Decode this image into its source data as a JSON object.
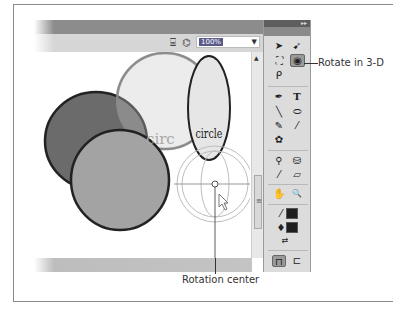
{
  "figure": {
    "callouts": {
      "rotate_3d": "Rotate in 3-D",
      "rotation_center": "Rotation center"
    }
  },
  "edit_bar": {
    "icons": [
      "edit-scene-icon",
      "edit-symbols-icon"
    ],
    "zoom_value": "100%",
    "zoom_dropdown_arrow": "▼"
  },
  "stage": {
    "objects": [
      {
        "type": "circle",
        "fill": "#6b6b6b",
        "stroke": "#222222"
      },
      {
        "type": "circle",
        "fill": "#a3a3a3",
        "stroke": "#222222"
      },
      {
        "type": "text-circle-ghost",
        "label": "circ",
        "color": "#b0b0b0"
      },
      {
        "type": "ellipse",
        "label": "circle",
        "fill": "#e6e6e6",
        "stroke": "#222222"
      }
    ],
    "gizmo": "3d-rotation-guides"
  },
  "tools_panel": {
    "collapse_glyph": "▸▸",
    "tools": [
      {
        "name": "selection-tool",
        "glyph": "➤"
      },
      {
        "name": "subselection-tool",
        "glyph": "➹"
      },
      {
        "name": "free-transform-tool",
        "glyph": "⛶"
      },
      {
        "name": "3d-rotation-tool",
        "glyph": "◉",
        "selected": true
      },
      {
        "name": "lasso-tool",
        "glyph": "ᑭ"
      },
      {
        "name": "pen-tool",
        "glyph": "✒"
      },
      {
        "name": "text-tool",
        "glyph": "T"
      },
      {
        "name": "line-tool",
        "glyph": "╲"
      },
      {
        "name": "oval-tool",
        "glyph": "⬭"
      },
      {
        "name": "pencil-tool",
        "glyph": "✎"
      },
      {
        "name": "brush-tool",
        "glyph": "⁄"
      },
      {
        "name": "deco-tool",
        "glyph": "✿"
      },
      {
        "name": "bone-tool",
        "glyph": "⚲"
      },
      {
        "name": "paint-bucket-tool",
        "glyph": "⛁"
      },
      {
        "name": "eyedropper-tool",
        "glyph": "⁄"
      },
      {
        "name": "eraser-tool",
        "glyph": "▱"
      },
      {
        "name": "hand-tool",
        "glyph": "✋"
      },
      {
        "name": "zoom-tool",
        "glyph": "🔍"
      },
      {
        "name": "stroke-color",
        "glyph": "⁄"
      },
      {
        "name": "fill-color",
        "glyph": "♦"
      },
      {
        "name": "swap-colors",
        "glyph": "⇄"
      },
      {
        "name": "snap-to-objects",
        "glyph": "⊓"
      },
      {
        "name": "option-icon",
        "glyph": "⊏"
      }
    ],
    "colors": {
      "stroke": "#1e1e1e",
      "fill": "#1e1e1e"
    }
  },
  "scrollbar": {
    "up_arrow": "▲",
    "grip": "≡"
  }
}
